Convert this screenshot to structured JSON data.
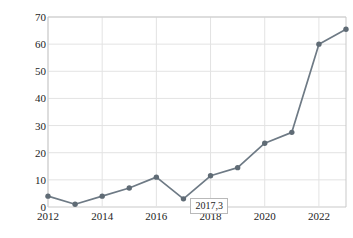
{
  "chart_data": {
    "type": "line",
    "title": "",
    "xlabel": "",
    "ylabel": "专利数量/项",
    "x": [
      2012,
      2013,
      2014,
      2015,
      2016,
      2017,
      2018,
      2019,
      2020,
      2021,
      2022,
      2023
    ],
    "values": [
      4,
      1,
      4,
      7,
      11,
      3,
      11.5,
      14.5,
      23.5,
      27.5,
      60,
      65.5
    ],
    "series": [
      {
        "name": "专利数量",
        "values": [
          4,
          1,
          4,
          7,
          11,
          3,
          11.5,
          14.5,
          23.5,
          27.5,
          60,
          65.5
        ]
      }
    ],
    "xlim": [
      2012,
      2023
    ],
    "ylim": [
      0,
      70
    ],
    "ytick_labels": [
      "0",
      "10",
      "20",
      "30",
      "40",
      "50",
      "60",
      "70"
    ],
    "ytick_values": [
      0,
      10,
      20,
      30,
      40,
      50,
      60,
      70
    ],
    "xtick_labels": [
      "2012",
      "2014",
      "2016",
      "2018",
      "2020",
      "2022"
    ],
    "xtick_values": [
      2012,
      2014,
      2016,
      2018,
      2020,
      2022
    ],
    "grid": "both",
    "legend": "none",
    "line_color": "#6e7a85",
    "marker_color": "#5f6b75",
    "grid_color": "#e3e3e3",
    "annotations": [
      {
        "label": "2017,3",
        "x": 2017,
        "y": 3
      }
    ]
  }
}
